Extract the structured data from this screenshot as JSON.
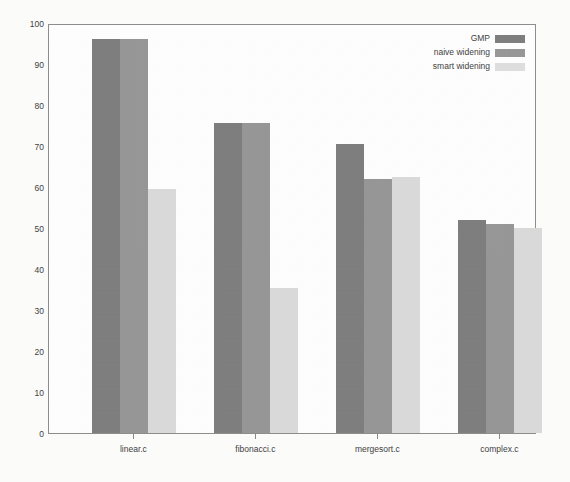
{
  "chart_data": {
    "type": "bar",
    "title": "",
    "subtitle": "",
    "xlabel": "",
    "ylabel": "",
    "categories": [
      "linear.c",
      "fibonacci.c",
      "mergesort.c",
      "complex.c"
    ],
    "series": [
      {
        "name": "GMP",
        "color": "#7c7c7c",
        "values": [
          96.0,
          75.6,
          70.5,
          52.0
        ]
      },
      {
        "name": "naive widening",
        "color": "#979797",
        "values": [
          96.0,
          75.6,
          62.0,
          51.0
        ]
      },
      {
        "name": "smart widening",
        "color": "#e2e2e2",
        "values": [
          59.5,
          35.4,
          62.4,
          50.0
        ]
      }
    ],
    "ylim": [
      0,
      100
    ],
    "yticks": [
      0,
      10,
      20,
      30,
      40,
      50,
      60,
      70,
      80,
      90,
      100
    ],
    "ytick_labels": [
      "0",
      "10",
      "20",
      "30",
      "40",
      "50",
      "60",
      "70",
      "80",
      "90",
      "100"
    ],
    "grid": false,
    "legend_position": "upper right",
    "frame": true
  },
  "legend": {
    "entries": [
      {
        "label": "GMP",
        "swatch_color": "#7c7c7c"
      },
      {
        "label": "naive widening",
        "swatch_color": "#979797"
      },
      {
        "label": "smart widening",
        "swatch_color": "#e2e2e2"
      }
    ]
  },
  "axes": {
    "y_axis_name": "y-axis",
    "x_axis_name": "x-axis"
  }
}
